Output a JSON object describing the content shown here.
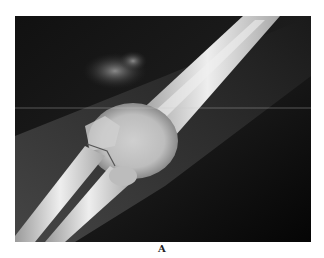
{
  "figure": {
    "type": "radiograph",
    "caption": "A",
    "colors": {
      "background": "#0b0b0b",
      "soft_tissue": "#3a3a3a",
      "bone": "#d8d8d8",
      "bone_highlight": "#f2f2f2"
    }
  }
}
